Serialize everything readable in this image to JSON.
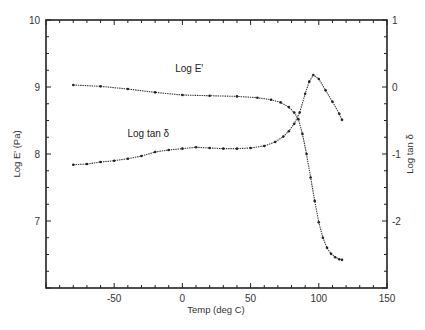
{
  "chart_data": {
    "type": "line",
    "title": "",
    "xlabel": "Temp (deg C)",
    "ylabel": "Log E'   (Pa)",
    "y2label": "Log tan δ",
    "xlim": [
      -100,
      150
    ],
    "ylim": [
      6,
      10
    ],
    "y2lim": [
      -3,
      1
    ],
    "xticks": [
      -50,
      0,
      50,
      100,
      150
    ],
    "yticks": [
      7,
      8,
      9,
      10
    ],
    "y2ticks": [
      -2,
      -1,
      0,
      1
    ],
    "grid": false,
    "legend": "none",
    "annotations": [
      {
        "text": "Log E'",
        "x": 5,
        "y": 9.22,
        "axis": "left"
      },
      {
        "text": "Log tan δ",
        "x": -25,
        "y": 8.25,
        "axis": "left"
      }
    ],
    "series": [
      {
        "name": "Log E'",
        "axis": "left",
        "marker": "dense-dots",
        "x": [
          -80,
          -60,
          -40,
          -20,
          0,
          20,
          40,
          55,
          65,
          72,
          78,
          82,
          85,
          88,
          91,
          94,
          97,
          100,
          103,
          106,
          109,
          112,
          115,
          117
        ],
        "y": [
          9.03,
          9.01,
          8.97,
          8.92,
          8.88,
          8.87,
          8.86,
          8.84,
          8.81,
          8.77,
          8.7,
          8.62,
          8.52,
          8.3,
          8.0,
          7.65,
          7.3,
          6.98,
          6.75,
          6.6,
          6.51,
          6.46,
          6.43,
          6.42
        ]
      },
      {
        "name": "Log tan δ",
        "axis": "right",
        "marker": "dense-dots",
        "x": [
          -80,
          -70,
          -60,
          -50,
          -40,
          -30,
          -20,
          -10,
          0,
          10,
          20,
          30,
          40,
          50,
          60,
          68,
          74,
          78,
          82,
          86,
          90,
          93,
          96,
          100,
          105,
          110,
          115,
          117
        ],
        "y": [
          -1.16,
          -1.15,
          -1.12,
          -1.1,
          -1.07,
          -1.03,
          -0.97,
          -0.94,
          -0.92,
          -0.9,
          -0.91,
          -0.92,
          -0.92,
          -0.91,
          -0.88,
          -0.82,
          -0.74,
          -0.66,
          -0.55,
          -0.38,
          -0.1,
          0.08,
          0.18,
          0.12,
          -0.05,
          -0.22,
          -0.4,
          -0.49
        ]
      }
    ]
  }
}
